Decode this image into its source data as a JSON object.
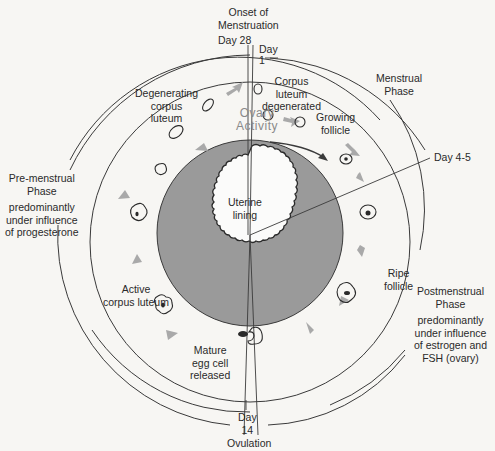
{
  "diagram": {
    "title_top": [
      "Onset of",
      "Menstruation"
    ],
    "markers": {
      "day28": "Day 28",
      "day1": [
        "Day",
        "1"
      ],
      "day4_5": "Day 4-5",
      "day14": [
        "Day",
        "14"
      ],
      "ovulation": "Ovulation"
    },
    "phases": {
      "menstrual": [
        "Menstrual",
        "Phase"
      ],
      "premenstrual": [
        "Pre-menstrual",
        "Phase"
      ],
      "premenstrual_note": [
        "predominantly",
        "under influence",
        "of progesterone"
      ],
      "postmenstrual": [
        "Postmenstrual",
        "Phase"
      ],
      "postmenstrual_note": [
        "predominantly",
        "under influence",
        "of estrogen and",
        "FSH (ovary)"
      ]
    },
    "stages": {
      "corpus_luteum_degenerated": [
        "Corpus",
        "luteum",
        "degenerated"
      ],
      "growing_follicle": [
        "Growing",
        "follicle"
      ],
      "ripe_follicle": [
        "Ripe",
        "follicle"
      ],
      "mature_egg": [
        "Mature",
        "egg cell",
        "released"
      ],
      "active_corpus_luteum": [
        "Active",
        "corpus luteum"
      ],
      "degenerating_corpus_luteum": [
        "Degenerating",
        "corpus",
        "luteum"
      ]
    },
    "center": {
      "ovary_activity": [
        "Ovary",
        "Activity"
      ],
      "uterine_lining": [
        "Uterine",
        "lining"
      ]
    },
    "colors": {
      "background": "#f7f6f3",
      "uterus_fill": "#9a9a9a",
      "line": "#3a3a3a",
      "arrow": "#a9a9a9",
      "text": "#2a2a2a"
    }
  }
}
